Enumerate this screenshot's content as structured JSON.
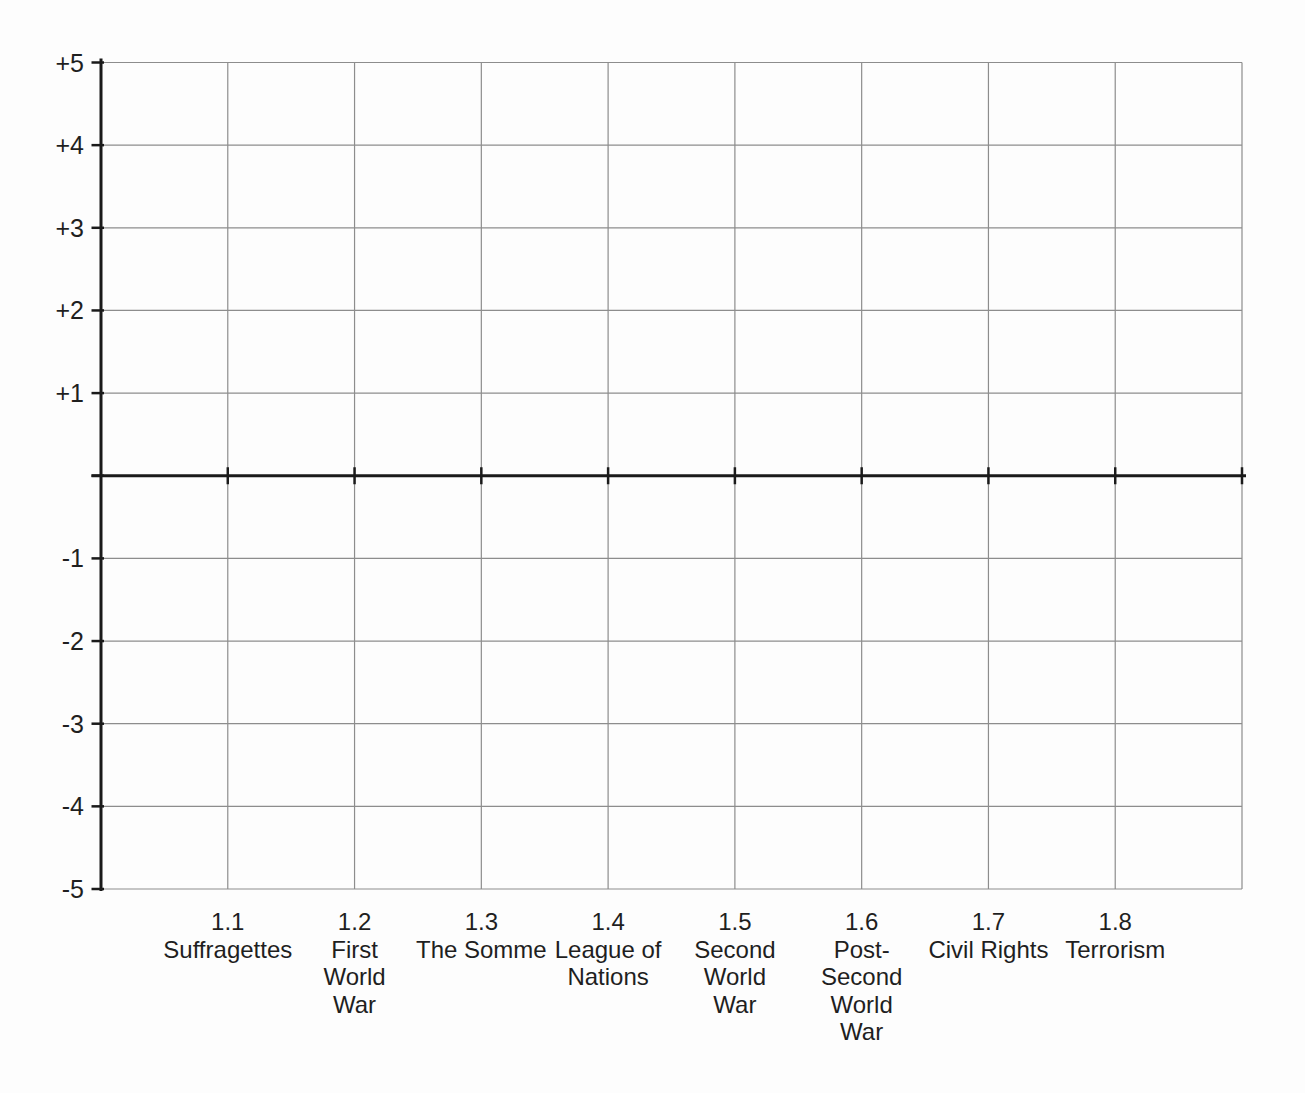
{
  "page": {
    "background": "#fdfdfd"
  },
  "chart_data": {
    "type": "line",
    "title": "",
    "y_axis": {
      "min": -5,
      "max": 5,
      "step": 1,
      "zero_baseline": true,
      "tick_labels": [
        {
          "value": 5,
          "label": "+5"
        },
        {
          "value": 4,
          "label": "+4"
        },
        {
          "value": 3,
          "label": "+3"
        },
        {
          "value": 2,
          "label": "+2"
        },
        {
          "value": 1,
          "label": "+1"
        },
        {
          "value": 0,
          "label": ""
        },
        {
          "value": -1,
          "label": "-1"
        },
        {
          "value": -2,
          "label": "-2"
        },
        {
          "value": -3,
          "label": "-3"
        },
        {
          "value": -4,
          "label": "-4"
        },
        {
          "value": -5,
          "label": "-5"
        }
      ]
    },
    "x_axis": {
      "categories": [
        {
          "code": "1.1",
          "label": "Suffragettes",
          "lines": [
            "Suffragettes"
          ]
        },
        {
          "code": "1.2",
          "label": "First World War",
          "lines": [
            "First",
            "World",
            "War"
          ]
        },
        {
          "code": "1.3",
          "label": "The Somme",
          "lines": [
            "The Somme"
          ]
        },
        {
          "code": "1.4",
          "label": "League of Nations",
          "lines": [
            "League of",
            "Nations"
          ]
        },
        {
          "code": "1.5",
          "label": "Second World War",
          "lines": [
            "Second",
            "World",
            "War"
          ]
        },
        {
          "code": "1.6",
          "label": "Post-Second World War",
          "lines": [
            "Post-",
            "Second",
            "World",
            "War"
          ]
        },
        {
          "code": "1.7",
          "label": "Civil Rights",
          "lines": [
            "Civil Rights"
          ]
        },
        {
          "code": "1.8",
          "label": "Terrorism",
          "lines": [
            "Terrorism"
          ]
        }
      ]
    },
    "series": [],
    "grid": {
      "show": true,
      "columns": 9,
      "rows": 10
    },
    "colors": {
      "grid_line": "#8d8d8d",
      "axis_line": "#1a1a1a",
      "label_text": "#1f1f1f",
      "background": "#fdfdfd"
    }
  }
}
